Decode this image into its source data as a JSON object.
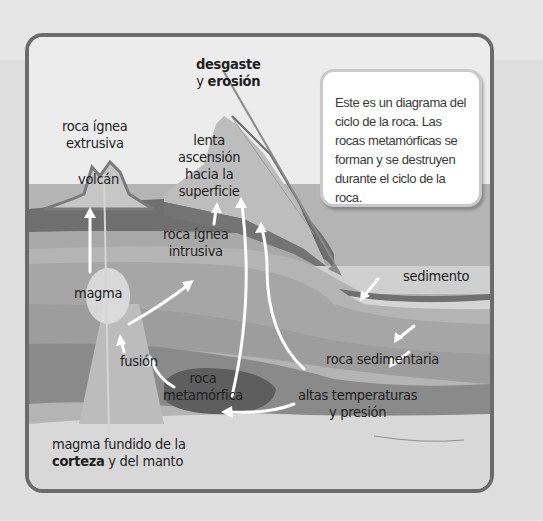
{
  "diagram": {
    "callout": {
      "text": "Este es un diagrama del ciclo de la roca. Las rocas metamórficas se forman y se destruyen durante el ciclo de la roca."
    },
    "labels": {
      "desgaste_line1": "desgaste",
      "desgaste_line2_prefix": "y ",
      "desgaste_line2_bold": "erosión",
      "extrusiva_line1": "roca ígnea",
      "extrusiva_line2": "extrusiva",
      "volcan": "volcán",
      "lenta_line1": "lenta",
      "lenta_line2": "ascensión",
      "lenta_line3": "hacia la",
      "lenta_line4": "superficie",
      "intrusiva_line1": "roca ígnea",
      "intrusiva_line2": "intrusiva",
      "magma": "magma",
      "sedimento": "sedimento",
      "fusion": "fusión",
      "roca_sedimentaria": "roca sedimentaria",
      "metamorfica_line1": "roca",
      "metamorfica_line2": "metamórfica",
      "altas_line1": "altas temperaturas",
      "altas_line2": "y presión",
      "fundido_line1": "magma fundido de la",
      "fundido_line2_bold": "corteza",
      "fundido_line2_rest": " y del manto"
    },
    "colors": {
      "frame": "#6b6b6b",
      "sky": "#ececec",
      "dark_band": "#6f6f6f",
      "mid_layer": "#a9a9a9",
      "light_layer": "#bdbdbd",
      "deep_layer": "#8c8c8c",
      "metamorphic": "#5e5e5e",
      "arrow": "#ffffff"
    }
  }
}
